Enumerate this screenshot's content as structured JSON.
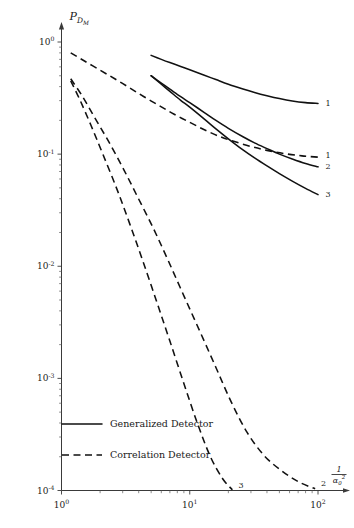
{
  "chart_data": {
    "type": "line",
    "title": "",
    "subtitle": "",
    "xlabel": "1/alpha_0^2",
    "xlabel_display": "1",
    "xlabel_denominator": "α",
    "xlabel_denominator_sub": "0",
    "xlabel_denominator_sup": "2",
    "ylabel": "P_DM",
    "ylabel_main": "P",
    "ylabel_sub": "D",
    "ylabel_subsub": "M",
    "xscale": "log",
    "yscale": "log",
    "xlim": [
      1,
      125
    ],
    "ylim": [
      0.0001,
      1.35
    ],
    "grid": false,
    "legend_position": "lower-left-inside",
    "xticks": [
      {
        "value": 1,
        "label_mantissa": "10",
        "label_exponent": "0"
      },
      {
        "value": 10,
        "label_mantissa": "10",
        "label_exponent": "1"
      },
      {
        "value": 100,
        "label_mantissa": "10",
        "label_exponent": "2"
      }
    ],
    "yticks": [
      {
        "value": 1,
        "label_mantissa": "10",
        "label_exponent": "0"
      },
      {
        "value": 0.1,
        "label_mantissa": "10",
        "label_exponent": "-1"
      },
      {
        "value": 0.01,
        "label_mantissa": "10",
        "label_exponent": "-2"
      },
      {
        "value": 0.001,
        "label_mantissa": "10",
        "label_exponent": "-3"
      },
      {
        "value": 0.0001,
        "label_mantissa": "10",
        "label_exponent": "-4"
      }
    ],
    "legend": [
      {
        "label": "Generalized Detector",
        "style": "solid"
      },
      {
        "label": "Correlation Detector",
        "style": "dashed"
      }
    ],
    "series": [
      {
        "name": "Generalized Detector 1",
        "style": "solid",
        "end_label": "1",
        "points": [
          [
            5.0,
            0.76
          ],
          [
            6.0,
            0.7
          ],
          [
            7.0,
            0.655
          ],
          [
            8.5,
            0.605
          ],
          [
            10.0,
            0.565
          ],
          [
            13.0,
            0.505
          ],
          [
            16.0,
            0.462
          ],
          [
            20.0,
            0.42
          ],
          [
            26.0,
            0.381
          ],
          [
            32.0,
            0.355
          ],
          [
            40.0,
            0.332
          ],
          [
            50.0,
            0.313
          ],
          [
            63.0,
            0.298
          ],
          [
            80.0,
            0.288
          ],
          [
            100.0,
            0.283
          ]
        ]
      },
      {
        "name": "Generalized Detector 2",
        "style": "solid",
        "end_label": "2",
        "points": [
          [
            5.0,
            0.5
          ],
          [
            6.0,
            0.43
          ],
          [
            7.0,
            0.38
          ],
          [
            8.5,
            0.325
          ],
          [
            10.0,
            0.288
          ],
          [
            13.0,
            0.235
          ],
          [
            16.0,
            0.2
          ],
          [
            20.0,
            0.17
          ],
          [
            26.0,
            0.143
          ],
          [
            32.0,
            0.126
          ],
          [
            40.0,
            0.112
          ],
          [
            50.0,
            0.1
          ],
          [
            63.0,
            0.0905
          ],
          [
            80.0,
            0.0825
          ],
          [
            100.0,
            0.077
          ]
        ]
      },
      {
        "name": "Generalized Detector 3",
        "style": "solid",
        "end_label": "3",
        "points": [
          [
            5.0,
            0.5
          ],
          [
            6.0,
            0.42
          ],
          [
            7.0,
            0.363
          ],
          [
            8.5,
            0.302
          ],
          [
            10.0,
            0.262
          ],
          [
            13.0,
            0.205
          ],
          [
            16.0,
            0.168
          ],
          [
            20.0,
            0.137
          ],
          [
            26.0,
            0.109
          ],
          [
            32.0,
            0.0925
          ],
          [
            40.0,
            0.0785
          ],
          [
            50.0,
            0.067
          ],
          [
            63.0,
            0.0575
          ],
          [
            80.0,
            0.0495
          ],
          [
            100.0,
            0.0435
          ]
        ]
      },
      {
        "name": "Correlation Detector 1",
        "style": "dashed",
        "end_label": "1",
        "points": [
          [
            1.18,
            0.8
          ],
          [
            1.5,
            0.68
          ],
          [
            2.0,
            0.56
          ],
          [
            2.6,
            0.47
          ],
          [
            3.4,
            0.39
          ],
          [
            4.4,
            0.325
          ],
          [
            5.8,
            0.27
          ],
          [
            7.5,
            0.228
          ],
          [
            10.0,
            0.192
          ],
          [
            13.0,
            0.165
          ],
          [
            17.0,
            0.144
          ],
          [
            22.0,
            0.13
          ],
          [
            30.0,
            0.117
          ],
          [
            40.0,
            0.108
          ],
          [
            55.0,
            0.101
          ],
          [
            75.0,
            0.0965
          ],
          [
            100.0,
            0.094
          ]
        ]
      },
      {
        "name": "Correlation Detector 2",
        "style": "dashed",
        "end_label": "2",
        "points": [
          [
            1.18,
            0.47
          ],
          [
            1.45,
            0.33
          ],
          [
            1.8,
            0.215
          ],
          [
            2.3,
            0.133
          ],
          [
            3.0,
            0.076
          ],
          [
            3.9,
            0.042
          ],
          [
            5.2,
            0.0218
          ],
          [
            6.8,
            0.0112
          ],
          [
            9.0,
            0.00545
          ],
          [
            12.0,
            0.00262
          ],
          [
            16.0,
            0.00125
          ],
          [
            21.0,
            0.00062
          ],
          [
            28.0,
            0.00033
          ],
          [
            38.0,
            0.000205
          ],
          [
            52.0,
            0.00015
          ],
          [
            70.0,
            0.00012
          ],
          [
            95.0,
            0.0001035
          ]
        ]
      },
      {
        "name": "Correlation Detector 3",
        "style": "dashed",
        "end_label": "3",
        "points": [
          [
            1.18,
            0.45
          ],
          [
            1.4,
            0.3
          ],
          [
            1.7,
            0.18
          ],
          [
            2.1,
            0.1
          ],
          [
            2.7,
            0.049
          ],
          [
            3.4,
            0.024
          ],
          [
            4.3,
            0.0112
          ],
          [
            5.5,
            0.0049
          ],
          [
            7.0,
            0.00215
          ],
          [
            9.0,
            0.0009
          ],
          [
            11.5,
            0.000395
          ],
          [
            14.5,
            0.0002
          ],
          [
            18.0,
            0.000128
          ],
          [
            21.5,
            0.0001015
          ]
        ]
      }
    ]
  }
}
